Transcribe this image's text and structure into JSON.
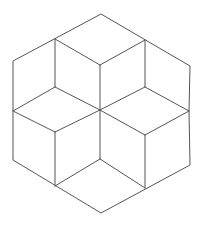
{
  "diagram": {
    "type": "rhombus-tiling-hexagon",
    "stroke_color": "#555555",
    "background": "#ffffff",
    "stroke_width": 1,
    "points": {
      "top": [
        101,
        14
      ],
      "tr": [
        190,
        66
      ],
      "r": [
        189,
        111
      ],
      "br": [
        190,
        165
      ],
      "bottom": [
        101,
        213
      ],
      "bl": [
        13,
        160
      ],
      "l": [
        13,
        111
      ],
      "tl": [
        13,
        61
      ],
      "a": [
        55,
        39
      ],
      "b": [
        145,
        40
      ],
      "c": [
        100,
        65
      ],
      "d": [
        55,
        87
      ],
      "e": [
        145,
        87
      ],
      "center": [
        100,
        110
      ],
      "f": [
        55,
        132
      ],
      "g": [
        145,
        135
      ],
      "h": [
        100,
        159
      ],
      "i": [
        55,
        186
      ],
      "j": [
        145,
        188
      ]
    },
    "outline": [
      "top",
      "tr",
      "r",
      "br",
      "bottom",
      "bl",
      "l",
      "tl"
    ],
    "edges": [
      [
        "a",
        "c"
      ],
      [
        "b",
        "c"
      ],
      [
        "a",
        "d"
      ],
      [
        "b",
        "e"
      ],
      [
        "c",
        "center"
      ],
      [
        "d",
        "center"
      ],
      [
        "e",
        "center"
      ],
      [
        "l",
        "d"
      ],
      [
        "r",
        "e"
      ],
      [
        "l",
        "f"
      ],
      [
        "r",
        "g"
      ],
      [
        "f",
        "center"
      ],
      [
        "g",
        "center"
      ],
      [
        "center",
        "h"
      ],
      [
        "f",
        "i"
      ],
      [
        "g",
        "j"
      ],
      [
        "h",
        "i"
      ],
      [
        "h",
        "j"
      ]
    ]
  }
}
